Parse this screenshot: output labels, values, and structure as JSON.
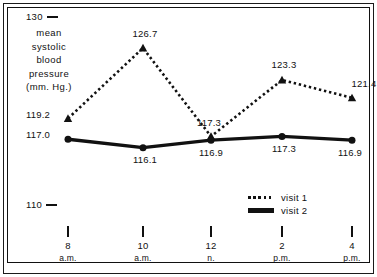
{
  "chart_data": {
    "type": "line",
    "title": "",
    "xlabel": "",
    "ylabel": "mean systolic blood pressure (mm. Hg.)",
    "ylabel_lines": [
      "mean",
      "systolic",
      "blood",
      "pressure",
      "(mm. Hg.)"
    ],
    "ylim": [
      110,
      130
    ],
    "ytick_labels": [
      "130",
      "110"
    ],
    "ytick_values": [
      130,
      110
    ],
    "grid": false,
    "legend_position": "bottom-right",
    "categories": [
      "8 a.m.",
      "10 a.m.",
      "12 n.",
      "2 p.m.",
      "4 p.m."
    ],
    "xtick_hours": [
      "8",
      "10",
      "12",
      "2",
      "4"
    ],
    "xtick_meridiem": [
      "a.m.",
      "a.m.",
      "n.",
      "p.m.",
      "p.m."
    ],
    "series": [
      {
        "name": "visit 1",
        "style": "dotted",
        "marker": "triangle",
        "values": [
          119.2,
          126.7,
          117.3,
          123.3,
          121.4
        ],
        "labels": [
          "119.2",
          "126.7",
          "117.3",
          "123.3",
          "121.4"
        ]
      },
      {
        "name": "visit 2",
        "style": "solid",
        "marker": "circle",
        "values": [
          117.0,
          116.1,
          116.9,
          117.3,
          116.9
        ],
        "labels": [
          "117.0",
          "116.1",
          "116.9",
          "117.3",
          "116.9"
        ]
      }
    ]
  },
  "legend": {
    "items": [
      {
        "label": "visit 1",
        "style": "dotted"
      },
      {
        "label": "visit 2",
        "style": "solid"
      }
    ]
  },
  "colors": {
    "ink": "#111111",
    "background": "#ffffff"
  }
}
